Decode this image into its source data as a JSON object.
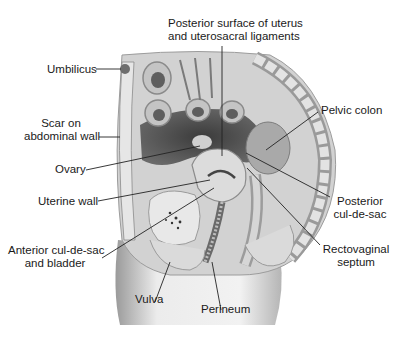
{
  "figure": {
    "labels": {
      "posterior_surface_line1": "Posterior surface of uterus",
      "posterior_surface_line2": "and uterosacral ligaments",
      "umbilicus": "Umbilicus",
      "scar_line1": "Scar on",
      "scar_line2": "abdominal wall",
      "ovary": "Ovary",
      "uterine_wall": "Uterine wall",
      "anterior_line1": "Anterior cul-de-sac",
      "anterior_line2": "and bladder",
      "vulva": "Vulva",
      "perineum": "Perineum",
      "pelvic_colon": "Pelvic colon",
      "posterior_cds_line1": "Posterior",
      "posterior_cds_line2": "cul-de-sac",
      "rectovaginal_line1": "Rectovaginal",
      "rectovaginal_line2": "septum"
    },
    "colors": {
      "background": "#ffffff",
      "text": "#1a1a1a",
      "leader_line": "#222222",
      "tissue_light": "#d9d9d9",
      "tissue_mid": "#a8a8a8",
      "cavity_dark": "#4a4a4a"
    }
  }
}
